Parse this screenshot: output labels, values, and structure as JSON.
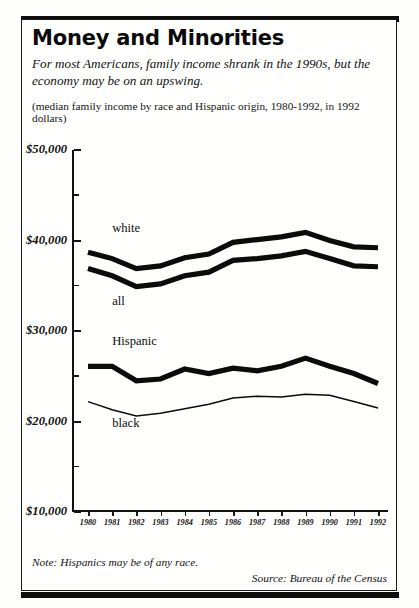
{
  "header": {
    "title": "Money and Minorities",
    "subtitle": "For most Americans, family income shrank in the 1990s, but the economy may be on an upswing.",
    "parenthetical": "(median family income by race and Hispanic origin, 1980-1992, in 1992 dollars)"
  },
  "footer": {
    "note": "Note: Hispanics may be of any race.",
    "source": "Source: Bureau of the Census"
  },
  "axis": {
    "y_ticks": [
      "$50,000",
      "$40,000",
      "$30,000",
      "$20,000",
      "$10,000"
    ],
    "x_ticks": [
      "1980",
      "1981",
      "1982",
      "1983",
      "1984",
      "1985",
      "1986",
      "1987",
      "1988",
      "1989",
      "1990",
      "1991",
      "1992"
    ]
  },
  "chart_data": {
    "type": "line",
    "title": "Money and Minorities",
    "subtitle": "For most Americans, family income shrank in the 1990s, but the economy may be on an upswing.",
    "caption": "(median family income by race and Hispanic origin, 1980-1992, in 1992 dollars)",
    "xlabel": "",
    "ylabel": "",
    "x": [
      1980,
      1981,
      1982,
      1983,
      1984,
      1985,
      1986,
      1987,
      1988,
      1989,
      1990,
      1991,
      1992
    ],
    "ylim": [
      10000,
      50000
    ],
    "ytick_values": [
      50000,
      40000,
      30000,
      20000,
      10000
    ],
    "yminor_values": [
      45000,
      35000,
      25000,
      15000
    ],
    "grid": false,
    "legend": "inline-labels",
    "note": "Note: Hispanics may be of any race.",
    "source": "Source: Bureau of the Census",
    "series": [
      {
        "name": "white",
        "style": "thick",
        "label_x": 1981.0,
        "label_y": 41200,
        "values": [
          38700,
          38000,
          36900,
          37200,
          38100,
          38500,
          39800,
          40100,
          40400,
          40900,
          40000,
          39300,
          39200
        ]
      },
      {
        "name": "all",
        "style": "thick",
        "label_x": 1981.0,
        "label_y": 33100,
        "values": [
          36900,
          36100,
          34900,
          35200,
          36100,
          36500,
          37800,
          38000,
          38300,
          38800,
          38000,
          37200,
          37100
        ]
      },
      {
        "name": "Hispanic",
        "style": "thick",
        "label_x": 1981.0,
        "label_y": 28700,
        "values": [
          26100,
          26100,
          24500,
          24700,
          25800,
          25300,
          25900,
          25600,
          26100,
          27000,
          26100,
          25300,
          24200
        ]
      },
      {
        "name": "black",
        "style": "thin",
        "label_x": 1981.0,
        "label_y": 19600,
        "values": [
          22200,
          21300,
          20600,
          20900,
          21400,
          21900,
          22600,
          22800,
          22700,
          23000,
          22900,
          22200,
          21500
        ]
      }
    ]
  }
}
